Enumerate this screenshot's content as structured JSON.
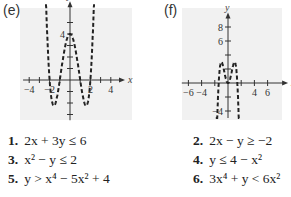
{
  "chart_data": [
    {
      "type": "line",
      "panel_label": "(e)",
      "xlabel": "x",
      "ylabel": "y",
      "xlim": [
        -4.6,
        5
      ],
      "ylim": [
        -3.5,
        6.5
      ],
      "x_tick_labels": [
        "-4",
        "-2",
        "2",
        "4"
      ],
      "x_ticks": [
        -4,
        -3,
        -2,
        -1,
        1,
        2,
        3,
        4
      ],
      "y_tick_labels": [
        "4"
      ],
      "y_ticks": [
        -3,
        -2,
        -1,
        1,
        2,
        3,
        4,
        5
      ],
      "grid": false,
      "shaded": true,
      "line_style": "dashed",
      "series": [
        {
          "name": "boundary",
          "function": "x^4 - 5x^2 + 4",
          "x_range": [
            -2.45,
            2.45
          ]
        }
      ]
    },
    {
      "type": "line",
      "panel_label": "(f)",
      "xlabel": "x",
      "ylabel": "y",
      "xlim": [
        -7,
        8.5
      ],
      "ylim": [
        -5,
        9.5
      ],
      "x_tick_labels": [
        "-6",
        "-4",
        "4",
        "6"
      ],
      "x_ticks": [
        -6,
        -4,
        -2,
        2,
        4,
        6
      ],
      "y_tick_labels": [
        "8",
        "6",
        "-4"
      ],
      "y_ticks": [
        -4,
        -2,
        2,
        4,
        6,
        8
      ],
      "grid": false,
      "shaded": true,
      "line_style": "dashed",
      "series": [
        {
          "name": "boundary",
          "function": "6x^2 - 3x^4",
          "x_range": [
            -1.85,
            1.85
          ]
        }
      ]
    }
  ],
  "equations": [
    {
      "num": "1.",
      "text": "2x + 3y ≤ 6"
    },
    {
      "num": "2.",
      "text": "2x − y ≥ −2"
    },
    {
      "num": "3.",
      "text": "x² − y ≤ 2"
    },
    {
      "num": "4.",
      "text": "y ≤ 4 − x²"
    },
    {
      "num": "5.",
      "text": "y > x⁴ − 5x² + 4"
    },
    {
      "num": "6.",
      "text": "3x⁴ + y < 6x²"
    }
  ]
}
